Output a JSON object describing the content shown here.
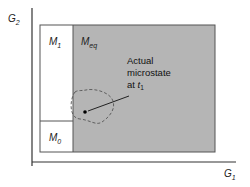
{
  "diagram": {
    "axes": {
      "x_label": "G",
      "x_label_sub": "1",
      "y_label": "G",
      "y_label_sub": "2"
    },
    "regions": [
      {
        "id": "M1",
        "label": "M",
        "sub": "1",
        "fill": "#ffffff"
      },
      {
        "id": "Meq",
        "label": "M",
        "sub": "eq",
        "fill": "#b5b5b5"
      },
      {
        "id": "M0",
        "label": "M",
        "sub": "0",
        "fill": "#ffffff"
      }
    ],
    "annotation": {
      "line1": "Actual",
      "line2": "microstate",
      "line3_prefix": "at ",
      "line3_var": "t",
      "line3_sub": "1"
    },
    "colors": {
      "shaded_region": "#b5b5b5",
      "outline": "#444444",
      "axis": "#333333"
    }
  }
}
